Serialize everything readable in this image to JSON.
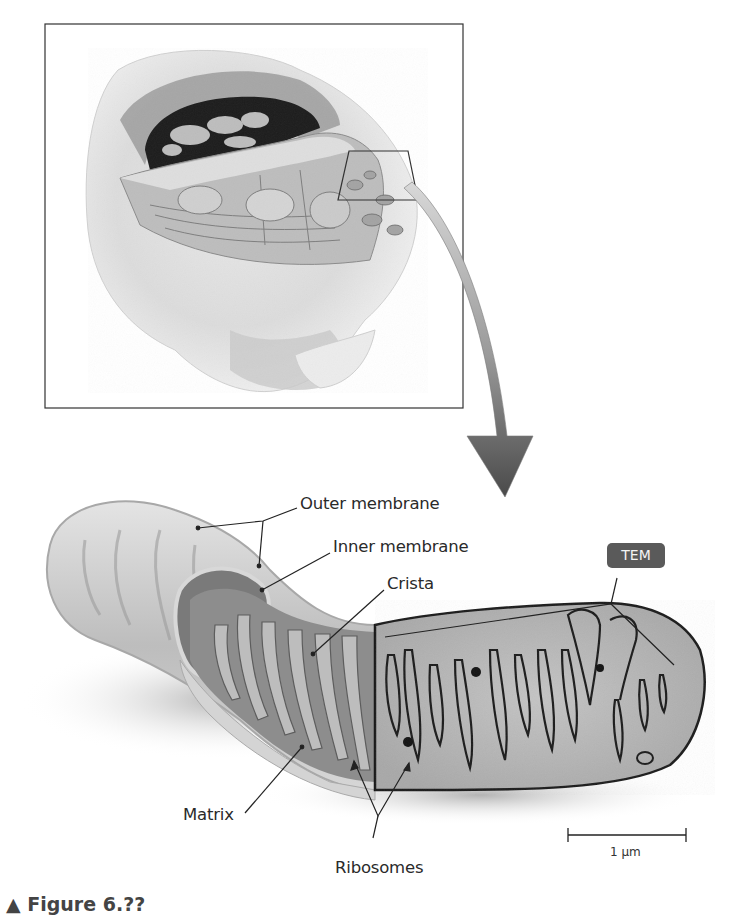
{
  "figure": {
    "inset": {
      "name": "cell cutaway with highlighted region",
      "frame_color": "#333333"
    },
    "magnify_arrow": {
      "color_start": "#cfcfcf",
      "color_end": "#4a4a4a"
    },
    "labels": {
      "outer_membrane": "Outer membrane",
      "inner_membrane": "Inner membrane",
      "crista": "Crista",
      "matrix": "Matrix",
      "ribosomes": "Ribosomes"
    },
    "badge": {
      "text": "TEM",
      "color": "#5a5a5a"
    },
    "scale_bar": {
      "label": "1 µm"
    },
    "caption": "▲ Figure 6.??"
  }
}
